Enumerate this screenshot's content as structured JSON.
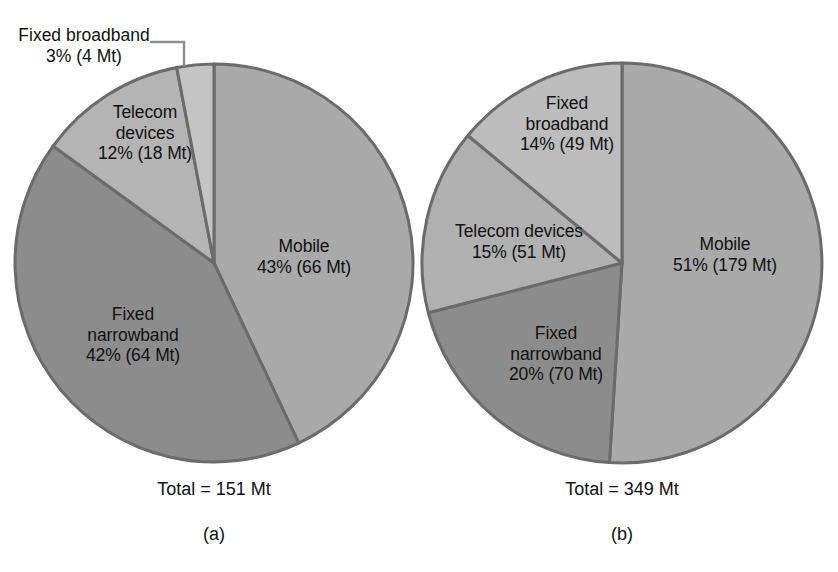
{
  "figure": {
    "background": "#ffffff",
    "border_color": "#6b6b6b",
    "text_color": "#111111"
  },
  "chart_data": [
    {
      "type": "pie",
      "id": "chart-a",
      "title": "",
      "caption": "(a)",
      "total_label": "Total = 151 Mt",
      "total_value": 151,
      "unit": "Mt",
      "legend": "none",
      "start_angle_deg": 0,
      "direction": "clockwise",
      "categories": [
        "Mobile",
        "Fixed narrowband",
        "Telecom devices",
        "Fixed broadband"
      ],
      "values": [
        66,
        64,
        18,
        4
      ],
      "percents": [
        43,
        42,
        12,
        3
      ],
      "colors": [
        "#a9a9a9",
        "#8c8c8c",
        "#b4b4b4",
        "#c4c4c4"
      ],
      "slices": [
        {
          "name": "Mobile",
          "percent": 43,
          "value": 66,
          "color": "#a9a9a9",
          "label_lines": [
            "Mobile",
            "43% (66 Mt)"
          ],
          "label_placement": "inside"
        },
        {
          "name": "Fixed narrowband",
          "percent": 42,
          "value": 64,
          "color": "#8c8c8c",
          "label_lines": [
            "Fixed",
            "narrowband",
            "42% (64 Mt)"
          ],
          "label_placement": "inside"
        },
        {
          "name": "Telecom devices",
          "percent": 12,
          "value": 18,
          "color": "#b4b4b4",
          "label_lines": [
            "Telecom",
            "devices",
            "12% (18 Mt)"
          ],
          "label_placement": "inside"
        },
        {
          "name": "Fixed broadband",
          "percent": 3,
          "value": 4,
          "color": "#c4c4c4",
          "label_lines": [
            "Fixed broadband",
            "3% (4 Mt)"
          ],
          "label_placement": "callout"
        }
      ]
    },
    {
      "type": "pie",
      "id": "chart-b",
      "title": "",
      "caption": "(b)",
      "total_label": "Total = 349 Mt",
      "total_value": 349,
      "unit": "Mt",
      "legend": "none",
      "start_angle_deg": 0,
      "direction": "clockwise",
      "categories": [
        "Mobile",
        "Fixed narrowband",
        "Telecom devices",
        "Fixed broadband"
      ],
      "values": [
        179,
        70,
        51,
        49
      ],
      "percents": [
        51,
        20,
        15,
        14
      ],
      "colors": [
        "#a9a9a9",
        "#8c8c8c",
        "#b0b0b0",
        "#bcbcbc"
      ],
      "slices": [
        {
          "name": "Mobile",
          "percent": 51,
          "value": 179,
          "color": "#a9a9a9",
          "label_lines": [
            "Mobile",
            "51% (179 Mt)"
          ],
          "label_placement": "inside"
        },
        {
          "name": "Fixed narrowband",
          "percent": 20,
          "value": 70,
          "color": "#8c8c8c",
          "label_lines": [
            "Fixed",
            "narrowband",
            "20% (70 Mt)"
          ],
          "label_placement": "inside"
        },
        {
          "name": "Telecom devices",
          "percent": 15,
          "value": 51,
          "color": "#b0b0b0",
          "label_lines": [
            "Telecom devices",
            "15% (51 Mt)"
          ],
          "label_placement": "inside"
        },
        {
          "name": "Fixed broadband",
          "percent": 14,
          "value": 49,
          "color": "#bcbcbc",
          "label_lines": [
            "Fixed",
            "broadband",
            "14% (49 Mt)"
          ],
          "label_placement": "inside"
        }
      ]
    }
  ]
}
